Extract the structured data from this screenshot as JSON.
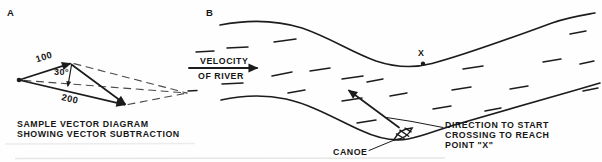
{
  "figure": {
    "colors": {
      "ink": "#1c1c1c",
      "background": "#fefefe",
      "construction": "#4a4a4a"
    },
    "panel_a": {
      "label": "A",
      "vector_100_label": "100",
      "vector_200_label": "200",
      "angle_label": "30°",
      "caption_line1": "SAMPLE VECTOR DIAGRAM",
      "caption_line2": "SHOWING VECTOR SUBTRACTION"
    },
    "panel_b": {
      "label": "B",
      "velocity_line1": "VELOCITY",
      "velocity_line2": "OF RIVER",
      "point_x_label": "X",
      "canoe_label": "CANOE",
      "direction_line1": "DIRECTION TO START",
      "direction_line2": "CROSSING TO REACH",
      "direction_line3": "POINT \"X\""
    }
  }
}
